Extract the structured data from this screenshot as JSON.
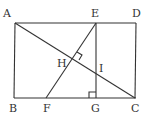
{
  "diagram": {
    "type": "geometry-figure",
    "points": {
      "A": "A",
      "B": "B",
      "C": "C",
      "D": "D",
      "E": "E",
      "F": "F",
      "G": "G",
      "H": "H",
      "I": "I"
    },
    "segments": [
      "AD",
      "AB",
      "BC",
      "DC",
      "AC",
      "EF",
      "EG"
    ],
    "right_angles": [
      "H (EF ⟂ AC)",
      "G (EG ⟂ BC)"
    ]
  }
}
